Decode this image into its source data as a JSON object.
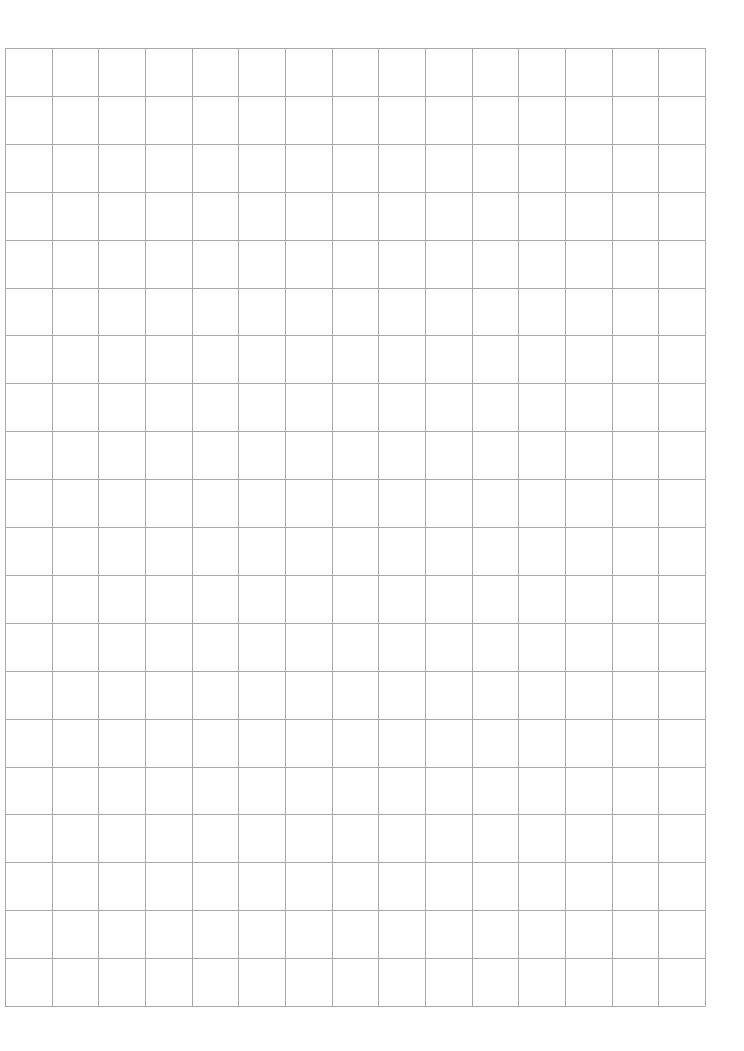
{
  "page": {
    "background": "#ffffff"
  },
  "grid": {
    "left": 5,
    "top": 48,
    "width": 700,
    "height": 958,
    "columns": 15,
    "rows": 20,
    "line_color": "#a8a8a8",
    "line_width": 1
  }
}
